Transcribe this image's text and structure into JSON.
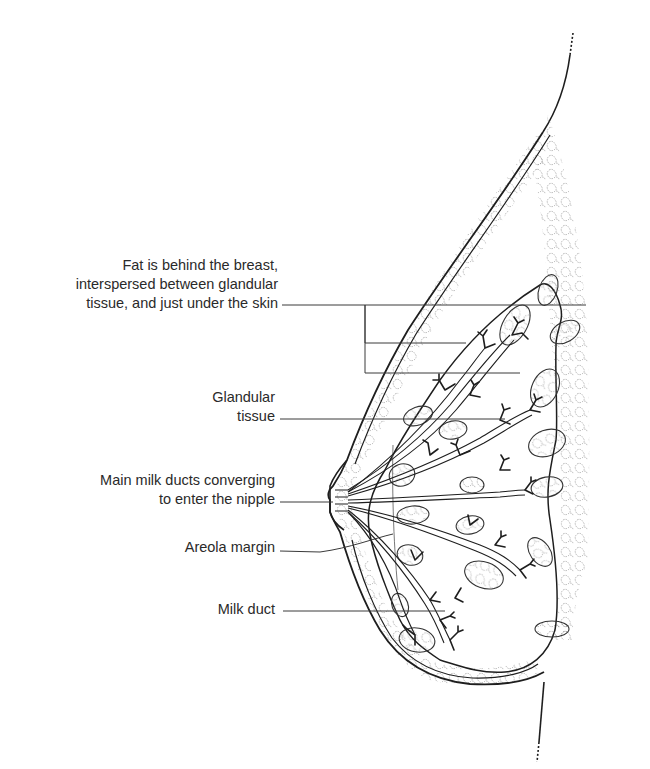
{
  "figure": {
    "colors": {
      "line": "#1e1e1e",
      "fat": "#7a7a7a",
      "leader": "#3a3a3a",
      "text": "#2a2a2a",
      "background": "#ffffff"
    }
  },
  "labels": [
    {
      "id": "fat",
      "lines": [
        "Fat is behind the breast,",
        "interspersed between glandular",
        "tissue, and just under the skin"
      ]
    },
    {
      "id": "glandular",
      "lines": [
        "Glandular",
        "tissue"
      ]
    },
    {
      "id": "ducts",
      "lines": [
        "Main milk ducts converging",
        "to enter the nipple"
      ]
    },
    {
      "id": "areola",
      "lines": [
        "Areola margin"
      ]
    },
    {
      "id": "milk-duct",
      "lines": [
        "Milk duct"
      ]
    }
  ]
}
